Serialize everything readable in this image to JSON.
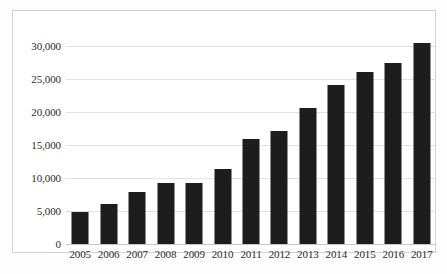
{
  "chart_data": {
    "type": "bar",
    "title": "",
    "subtitle": "",
    "xlabel": "",
    "ylabel": "",
    "categories": [
      "2005",
      "2006",
      "2007",
      "2008",
      "2009",
      "2010",
      "2011",
      "2012",
      "2013",
      "2014",
      "2015",
      "2016",
      "2017"
    ],
    "values": [
      4900,
      6000,
      7900,
      9300,
      9200,
      11300,
      15900,
      17100,
      20600,
      24100,
      26000,
      27400,
      30500
    ],
    "ylim": [
      0,
      31500
    ],
    "ytick_values": [
      0,
      5000,
      10000,
      15000,
      20000,
      25000,
      30000
    ],
    "ytick_labels": [
      "0",
      "5,000",
      "10,000",
      "15,000",
      "20,000",
      "25,000",
      "30,000"
    ],
    "grid": true,
    "grid_axis": "y",
    "legend": false,
    "legend_position": "none",
    "bar_color": "#1d1d1d",
    "annotations": []
  },
  "axes": {
    "y_max_display": 31500,
    "gridline_color": "#e2e2e2",
    "baseline_color": "#c8c8c8",
    "frame_color": "#d3d3d3",
    "plot_background": "#ffffff"
  }
}
